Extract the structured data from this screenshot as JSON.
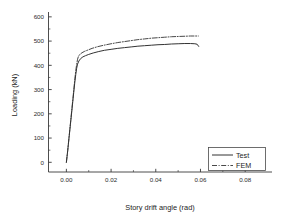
{
  "chart_data": {
    "type": "line",
    "title": "",
    "xlabel": "Story drift angle (rad)",
    "ylabel": "Loading (kN)",
    "xlim": [
      -0.008,
      0.092
    ],
    "ylim": [
      -40,
      620
    ],
    "xticks": [
      0.0,
      0.02,
      0.04,
      0.06,
      0.08
    ],
    "xticklabels": [
      "0.00",
      "0.02",
      "0.04",
      "0.06",
      "0.08"
    ],
    "yticks": [
      0,
      100,
      200,
      300,
      400,
      500,
      600
    ],
    "yticklabels": [
      "0",
      "100",
      "200",
      "300",
      "400",
      "500",
      "600"
    ],
    "x_minor_per_major": 1,
    "y_minor_per_major": 1,
    "grid": false,
    "legend_position": "lower-right",
    "frame": "left-bottom",
    "series": [
      {
        "name": "Test",
        "style": "solid",
        "color": "#333333",
        "width": 1.0,
        "x": [
          0.0,
          0.0006,
          0.0012,
          0.0018,
          0.0024,
          0.003,
          0.0034,
          0.0038,
          0.0042,
          0.0046,
          0.005,
          0.0056,
          0.0064,
          0.0074,
          0.0086,
          0.01,
          0.012,
          0.0145,
          0.017,
          0.02,
          0.023,
          0.026,
          0.029,
          0.032,
          0.035,
          0.038,
          0.041,
          0.044,
          0.047,
          0.05,
          0.053,
          0.0555,
          0.0575,
          0.0585,
          0.0592
        ],
        "y": [
          0,
          48,
          102,
          155,
          208,
          262,
          298,
          332,
          362,
          388,
          405,
          418,
          428,
          435,
          440,
          445,
          451,
          457,
          462,
          466,
          470,
          473,
          476,
          479,
          481,
          483,
          485,
          486,
          488,
          489,
          490,
          490,
          489,
          487,
          478
        ]
      },
      {
        "name": "FEM",
        "style": "dash-dot",
        "color": "#333333",
        "width": 0.9,
        "x": [
          0.0,
          0.0006,
          0.0012,
          0.0018,
          0.0024,
          0.003,
          0.0034,
          0.0038,
          0.0042,
          0.0046,
          0.005,
          0.0054,
          0.006,
          0.007,
          0.0082,
          0.0096,
          0.0115,
          0.014,
          0.0168,
          0.02,
          0.023,
          0.026,
          0.029,
          0.032,
          0.035,
          0.038,
          0.041,
          0.044,
          0.047,
          0.05,
          0.053,
          0.0555,
          0.0575,
          0.059
        ],
        "y": [
          0,
          50,
          105,
          160,
          215,
          270,
          308,
          345,
          378,
          404,
          425,
          437,
          445,
          452,
          458,
          463,
          470,
          477,
          483,
          489,
          494,
          498,
          502,
          506,
          509,
          512,
          514,
          516,
          518,
          519,
          520,
          521,
          521,
          521
        ]
      }
    ],
    "legend_entries": [
      {
        "label": "Test",
        "style": "solid"
      },
      {
        "label": "FEM",
        "style": "dash-dot"
      }
    ]
  }
}
